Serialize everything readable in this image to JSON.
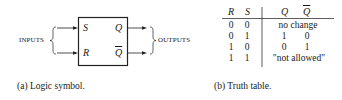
{
  "logic_symbol": {
    "inputs_label": "INPUTS",
    "outputs_label": "OUTPUTS",
    "pins": {
      "s": "S",
      "r": "R",
      "q": "Q",
      "q_bar": "Q"
    },
    "caption": "(a) Logic symbol."
  },
  "truth_table": {
    "headers": [
      "R",
      "S",
      "Q",
      "Q"
    ],
    "header_q_bar_overlined": true,
    "rows": [
      {
        "r": "0",
        "s": "0",
        "q": "no change",
        "q_bar": ""
      },
      {
        "r": "0",
        "s": "1",
        "q": "1",
        "q_bar": "0"
      },
      {
        "r": "1",
        "s": "0",
        "q": "0",
        "q_bar": "1"
      },
      {
        "r": "1",
        "s": "1",
        "q": "\"not allowed\"",
        "q_bar": ""
      }
    ],
    "caption": "(b) Truth table."
  }
}
